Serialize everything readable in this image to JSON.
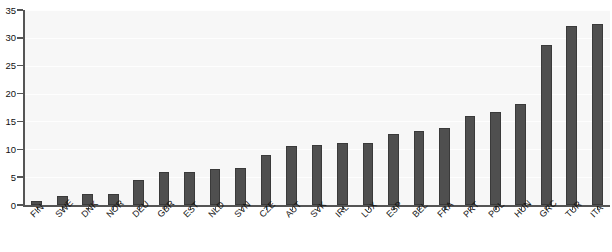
{
  "chart_data": {
    "type": "bar",
    "title": "",
    "subtitle": "",
    "xlabel": "",
    "ylabel": "",
    "ylim": [
      0,
      35
    ],
    "yticks": [
      0,
      5,
      10,
      15,
      20,
      25,
      30,
      35
    ],
    "ytick_labels": [
      "0",
      "5",
      "10",
      "15",
      "20",
      "25",
      "30",
      "35"
    ],
    "grid": true,
    "legend": null,
    "legend_position": "none",
    "orientation": "vertical",
    "sorted": "ascending",
    "categories": [
      "FIN",
      "SWE",
      "DNK",
      "NOR",
      "DEU",
      "GBR",
      "EST",
      "NLD",
      "SVN",
      "CZE",
      "AUT",
      "SVK",
      "IRL",
      "LUX",
      "ESP",
      "BEL",
      "FRA",
      "PRT",
      "POL",
      "HUN",
      "GRC",
      "TUR",
      "ITA"
    ],
    "values": [
      0.7,
      1.6,
      2.0,
      2.0,
      4.4,
      5.9,
      6.0,
      6.4,
      6.7,
      9.0,
      10.6,
      10.7,
      11.1,
      11.2,
      12.8,
      13.2,
      13.9,
      16.0,
      16.7,
      18.1,
      28.8,
      32.2,
      32.5
    ],
    "series": [
      {
        "name": "value",
        "values": [
          0.7,
          1.6,
          2.0,
          2.0,
          4.4,
          5.9,
          6.0,
          6.4,
          6.7,
          9.0,
          10.6,
          10.7,
          11.1,
          11.2,
          12.8,
          13.2,
          13.9,
          16.0,
          16.7,
          18.1,
          28.8,
          32.2,
          32.5
        ]
      }
    ]
  },
  "style": {
    "bar_color": "#4f4f4f",
    "bar_edge_color": "#3a3a3a",
    "plot_background": "#f7f7f7",
    "figure_background": "#ffffff",
    "axis_color": "#555555",
    "grid_color": "#ffffff",
    "tick_label_color": "#111111"
  }
}
